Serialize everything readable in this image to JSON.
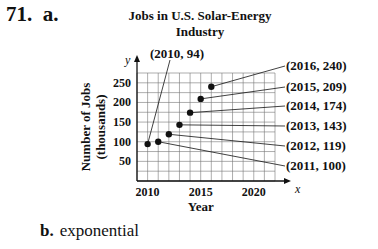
{
  "problem_number": "71.",
  "part_a_label": "a.",
  "part_b_label": "b.",
  "part_b_answer": "exponential",
  "chart_data": {
    "type": "scatter",
    "title": "Jobs in U.S. Solar-Energy Industry",
    "title_line1": "Jobs in U.S. Solar-Energy",
    "title_line2": "Industry",
    "xlabel": "Year",
    "ylabel": "Number of Jobs (thousands)",
    "ylabel_line1": "Number of Jobs",
    "ylabel_line2": "(thousands)",
    "x_axis_letter": "x",
    "y_axis_letter": "y",
    "xlim": [
      2009,
      2022
    ],
    "ylim": [
      0,
      275
    ],
    "xticks": [
      2010,
      2015,
      2020
    ],
    "yticks": [
      50,
      100,
      150,
      200,
      250
    ],
    "grid": true,
    "points": [
      {
        "x": 2010,
        "y": 94,
        "label": "(2010, 94)"
      },
      {
        "x": 2011,
        "y": 100,
        "label": "(2011, 100)"
      },
      {
        "x": 2012,
        "y": 119,
        "label": "(2012, 119)"
      },
      {
        "x": 2013,
        "y": 143,
        "label": "(2013, 143)"
      },
      {
        "x": 2014,
        "y": 174,
        "label": "(2014, 174)"
      },
      {
        "x": 2015,
        "y": 209,
        "label": "(2015, 209)"
      },
      {
        "x": 2016,
        "y": 240,
        "label": "(2016, 240)"
      }
    ]
  }
}
